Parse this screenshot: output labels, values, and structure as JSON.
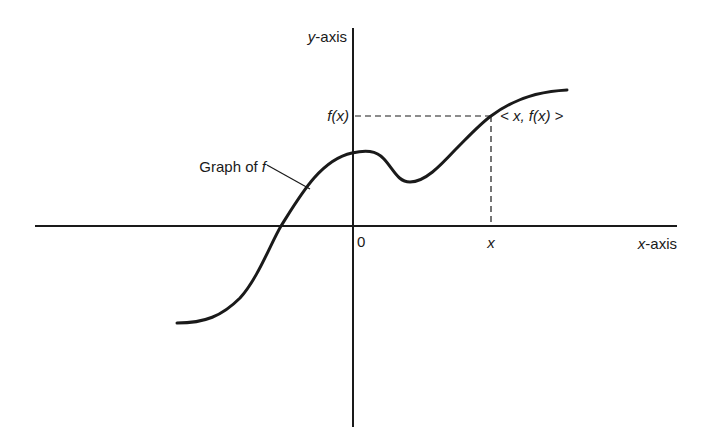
{
  "diagram": {
    "colors": {
      "ink": "#1a1a1a",
      "background": "#ffffff"
    },
    "axes": {
      "x_label_var": "x",
      "x_label_suffix": "-axis",
      "y_label_var": "y",
      "y_label_suffix": "-axis",
      "origin_label": "0"
    },
    "labels": {
      "curve_label_text": "Graph of ",
      "curve_label_var": "f",
      "fx_tick": "f(x)",
      "x_tick": "x",
      "point_label": "< x, f(x) >"
    }
  }
}
